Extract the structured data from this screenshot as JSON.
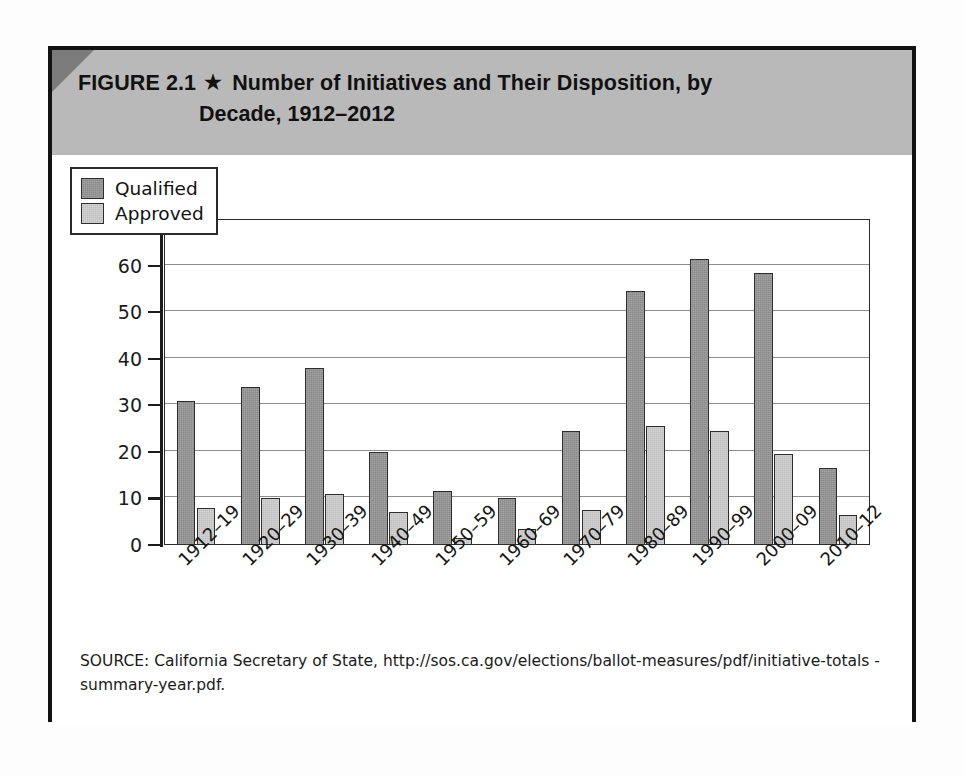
{
  "figure": {
    "number_label": "FIGURE 2.1",
    "star_glyph": "★",
    "title_line1": "Number of Initiatives and Their Disposition, by",
    "title_line2": "Decade, 1912–2012",
    "source_note": "SOURCE: California Secretary of State, http://sos.ca.gov/elections/ballot-measures/pdf/initiative-totals -summary-year.pdf.",
    "header_bg_color": "#b9b9b9",
    "corner_color": "#7b7b7b",
    "frame_color": "#121212"
  },
  "chart_data": {
    "type": "bar",
    "title": "Number of Initiatives and Their Disposition, by Decade, 1912–2012",
    "xlabel": "",
    "ylabel": "",
    "ylim": [
      0,
      70
    ],
    "ytick_step": 10,
    "yticks": [
      0,
      10,
      20,
      30,
      40,
      50,
      60,
      70
    ],
    "ytick_labels": [
      "0",
      "10",
      "20",
      "30",
      "40",
      "50",
      "60",
      "70"
    ],
    "grid": true,
    "grid_axis": "y",
    "legend_position": "upper-left-inside",
    "categories": [
      "1912–19",
      "1920–29",
      "1930–39",
      "1940–49",
      "1950–59",
      "1960–69",
      "1970–79",
      "1980–89",
      "1990–99",
      "2000–09",
      "2010–12"
    ],
    "series": [
      {
        "name": "Qualified",
        "color": "#8a8a8a",
        "values": [
          31,
          34,
          38,
          20,
          11.5,
          10,
          24.5,
          54.5,
          61.5,
          58.5,
          16.5
        ]
      },
      {
        "name": "Approved",
        "color": "#c0c0c0",
        "values": [
          8,
          10,
          11,
          7,
          1.5,
          3.5,
          7.5,
          25.5,
          24.5,
          19.5,
          6.5
        ]
      }
    ]
  }
}
